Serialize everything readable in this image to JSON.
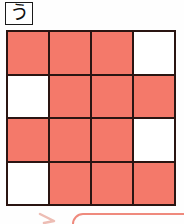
{
  "page": {
    "background_color": "#fefefe",
    "width": 184,
    "height": 224
  },
  "label": {
    "name": "question-label",
    "text": "う",
    "border_color": "#1a1a1a",
    "background_color": "#ffffff"
  },
  "grid": {
    "rows": 4,
    "columns": 4,
    "fill_color": "#f4796a",
    "empty_color": "#ffffff",
    "line_color": "#2a1512",
    "cells": [
      [
        1,
        1,
        1,
        0
      ],
      [
        0,
        1,
        1,
        1
      ],
      [
        1,
        1,
        1,
        0
      ],
      [
        0,
        1,
        1,
        1
      ]
    ],
    "filled_count": 12,
    "empty_count": 4
  },
  "bottom_shape": {
    "name": "rounded-rectangle-outline",
    "stroke_color": "#ef8a7d",
    "description": "partially visible rounded rectangle top edge"
  },
  "bottom_arrow": {
    "name": "arrow-mark",
    "stroke_color": "#e08878"
  }
}
